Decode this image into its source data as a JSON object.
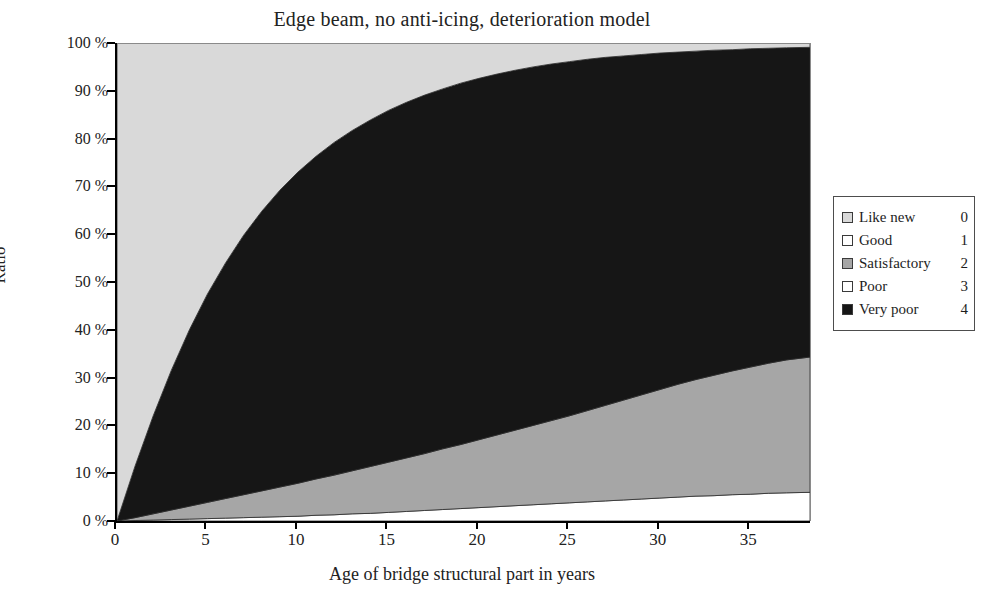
{
  "chart_data": {
    "type": "area",
    "title": "Edge beam, no anti-icing, deterioration model",
    "xlabel": "Age of bridge structural part in years",
    "ylabel": "Ratio",
    "xlim": [
      0,
      38.3
    ],
    "ylim": [
      0,
      100
    ],
    "xticks": [
      0,
      5,
      10,
      15,
      20,
      25,
      30,
      35
    ],
    "xtick_labels": [
      "0",
      "5",
      "10",
      "15",
      "20",
      "25",
      "30",
      "35"
    ],
    "yticks": [
      0,
      10,
      20,
      30,
      40,
      50,
      60,
      70,
      80,
      90,
      100
    ],
    "ytick_labels": [
      "0 %",
      "10 %",
      "20 %",
      "30 %",
      "40 %",
      "50 %",
      "60 %",
      "70 %",
      "80 %",
      "90 %",
      "100 %"
    ],
    "grid": false,
    "stacked": true,
    "stack_order_bottom_to_top": [
      "Good",
      "Satisfactory",
      "Very poor",
      "Like new"
    ],
    "legend_position": "right-outside",
    "x": [
      0,
      1,
      2,
      3,
      4,
      5,
      6,
      7,
      8,
      9,
      10,
      11,
      12,
      13,
      14,
      15,
      16,
      17,
      18,
      19,
      20,
      21,
      22,
      23,
      24,
      25,
      26,
      27,
      28,
      29,
      30,
      31,
      32,
      33,
      34,
      35,
      36,
      37,
      38.3
    ],
    "series": [
      {
        "name": "Like new",
        "condition_code": 0,
        "color": "#d9d9d9",
        "values": [
          100,
          88.5,
          78.0,
          68.5,
          60.0,
          52.5,
          46.0,
          40.2,
          35.2,
          30.8,
          27.0,
          23.7,
          20.8,
          18.3,
          16.1,
          14.1,
          12.4,
          10.9,
          9.6,
          8.4,
          7.4,
          6.5,
          5.7,
          5.0,
          4.4,
          3.9,
          3.4,
          3.0,
          2.7,
          2.4,
          2.1,
          1.9,
          1.7,
          1.5,
          1.4,
          1.2,
          1.1,
          1.0,
          0.9
        ]
      },
      {
        "name": "Good",
        "condition_code": 1,
        "color": "#ffffff",
        "values": [
          0,
          0.1,
          0.2,
          0.3,
          0.4,
          0.5,
          0.6,
          0.7,
          0.8,
          0.9,
          1.0,
          1.2,
          1.3,
          1.5,
          1.6,
          1.8,
          2.0,
          2.2,
          2.4,
          2.6,
          2.8,
          3.0,
          3.2,
          3.4,
          3.6,
          3.8,
          4.0,
          4.2,
          4.4,
          4.6,
          4.8,
          5.0,
          5.2,
          5.3,
          5.5,
          5.6,
          5.8,
          5.9,
          6.0
        ]
      },
      {
        "name": "Satisfactory",
        "condition_code": 2,
        "color": "#a6a6a6",
        "values": [
          0,
          0.6,
          1.3,
          2.0,
          2.7,
          3.4,
          4.1,
          4.8,
          5.5,
          6.2,
          6.9,
          7.6,
          8.3,
          9.0,
          9.8,
          10.5,
          11.2,
          11.9,
          12.7,
          13.4,
          14.2,
          15.0,
          15.8,
          16.6,
          17.4,
          18.2,
          19.1,
          20.0,
          20.9,
          21.8,
          22.7,
          23.6,
          24.4,
          25.2,
          25.9,
          26.6,
          27.2,
          27.8,
          28.3
        ]
      },
      {
        "name": "Poor",
        "condition_code": 3,
        "color": "#ffffff",
        "values": [
          0,
          0,
          0,
          0,
          0,
          0,
          0,
          0,
          0,
          0,
          0,
          0,
          0,
          0,
          0,
          0,
          0,
          0,
          0,
          0,
          0,
          0,
          0,
          0,
          0,
          0,
          0,
          0,
          0,
          0,
          0,
          0,
          0,
          0,
          0,
          0,
          0,
          0,
          0
        ]
      },
      {
        "name": "Very poor",
        "condition_code": 4,
        "color": "#161616",
        "values": [
          0,
          10.8,
          20.5,
          29.2,
          36.9,
          43.6,
          49.3,
          54.3,
          58.5,
          62.1,
          65.1,
          67.5,
          69.6,
          71.2,
          72.5,
          73.6,
          74.4,
          75.0,
          75.3,
          75.6,
          75.6,
          75.5,
          75.3,
          75.0,
          74.6,
          74.1,
          73.5,
          72.8,
          72.0,
          71.2,
          70.4,
          69.5,
          68.7,
          68.0,
          67.2,
          66.6,
          65.9,
          65.3,
          64.8
        ]
      }
    ]
  },
  "legend": {
    "items": [
      {
        "label": "Like new",
        "value": "0",
        "color": "#d9d9d9"
      },
      {
        "label": "Good",
        "value": "1",
        "color": "#ffffff"
      },
      {
        "label": "Satisfactory",
        "value": "2",
        "color": "#a6a6a6"
      },
      {
        "label": "Poor",
        "value": "3",
        "color": "#ffffff"
      },
      {
        "label": "Very poor",
        "value": "4",
        "color": "#161616"
      }
    ]
  }
}
